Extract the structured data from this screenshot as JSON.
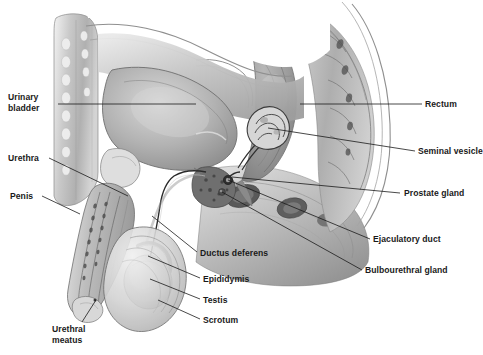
{
  "figure": {
    "background_color": "#ffffff",
    "ink_color": "#1a1a1a",
    "width": 483,
    "height": 355
  },
  "labels": [
    {
      "id": "urinary-bladder",
      "text": "Urinary\nbladder",
      "x": 8,
      "y": 92,
      "align": "left",
      "leader": [
        [
          58,
          104
        ],
        [
          196,
          104
        ]
      ]
    },
    {
      "id": "urethra",
      "text": "Urethra",
      "x": 8,
      "y": 153,
      "align": "left",
      "leader": [
        [
          49,
          158
        ],
        [
          128,
          196
        ]
      ]
    },
    {
      "id": "penis",
      "text": "Penis",
      "x": 10,
      "y": 191,
      "align": "left",
      "leader": [
        [
          42,
          196
        ],
        [
          80,
          214
        ]
      ]
    },
    {
      "id": "urethral-meatus",
      "text": "Urethral\nmeatus",
      "x": 52,
      "y": 324,
      "align": "left",
      "leader": [
        [
          82,
          322
        ],
        [
          96,
          300
        ]
      ]
    },
    {
      "id": "ductus-deferens",
      "text": "Ductus deferens",
      "x": 200,
      "y": 248,
      "align": "left",
      "leader": [
        [
          197,
          252
        ],
        [
          152,
          216
        ]
      ]
    },
    {
      "id": "epididymis",
      "text": "Epididymis",
      "x": 203,
      "y": 274,
      "align": "left",
      "leader": [
        [
          200,
          278
        ],
        [
          148,
          256
        ]
      ]
    },
    {
      "id": "testis",
      "text": "Testis",
      "x": 203,
      "y": 295,
      "align": "left",
      "leader": [
        [
          200,
          299
        ],
        [
          150,
          279
        ]
      ]
    },
    {
      "id": "scrotum",
      "text": "Scrotum",
      "x": 203,
      "y": 315,
      "align": "left",
      "leader": [
        [
          200,
          319
        ],
        [
          158,
          300
        ]
      ]
    },
    {
      "id": "rectum",
      "text": "Rectum",
      "x": 425,
      "y": 99,
      "align": "left",
      "leader": [
        [
          422,
          104
        ],
        [
          300,
          104
        ]
      ]
    },
    {
      "id": "seminal-vesicle",
      "text": "Seminal vesicle",
      "x": 418,
      "y": 146,
      "align": "left",
      "leader": [
        [
          415,
          151
        ],
        [
          268,
          128
        ]
      ]
    },
    {
      "id": "prostate-gland",
      "text": "Prostate gland",
      "x": 404,
      "y": 188,
      "align": "left",
      "leader": [
        [
          400,
          193
        ],
        [
          232,
          177
        ]
      ]
    },
    {
      "id": "ejaculatory-duct",
      "text": "Ejaculatory duct",
      "x": 373,
      "y": 234,
      "align": "left",
      "leader": [
        [
          370,
          239
        ],
        [
          228,
          180
        ]
      ]
    },
    {
      "id": "bulbourethral-gland",
      "text": "Bulbourethral gland",
      "x": 365,
      "y": 265,
      "align": "left",
      "leader": [
        [
          362,
          270
        ],
        [
          222,
          192
        ]
      ]
    }
  ]
}
